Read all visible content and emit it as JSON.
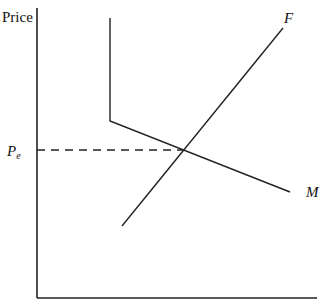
{
  "diagram": {
    "y_axis_label": "Price",
    "price_level_label": "P",
    "price_level_subscript": "e",
    "curve_f_label": "F",
    "curve_m_label": "M",
    "line_color": "#222222",
    "axes": {
      "origin": [
        37,
        298
      ],
      "y_top": 8,
      "x_right": 317
    },
    "curve_f": {
      "start": [
        122,
        226
      ],
      "end": [
        283,
        28
      ]
    },
    "curve_m": {
      "points": [
        [
          110,
          18
        ],
        [
          110,
          121
        ],
        [
          290,
          192
        ]
      ]
    },
    "equilibrium": {
      "x": 190,
      "y": 150
    }
  }
}
